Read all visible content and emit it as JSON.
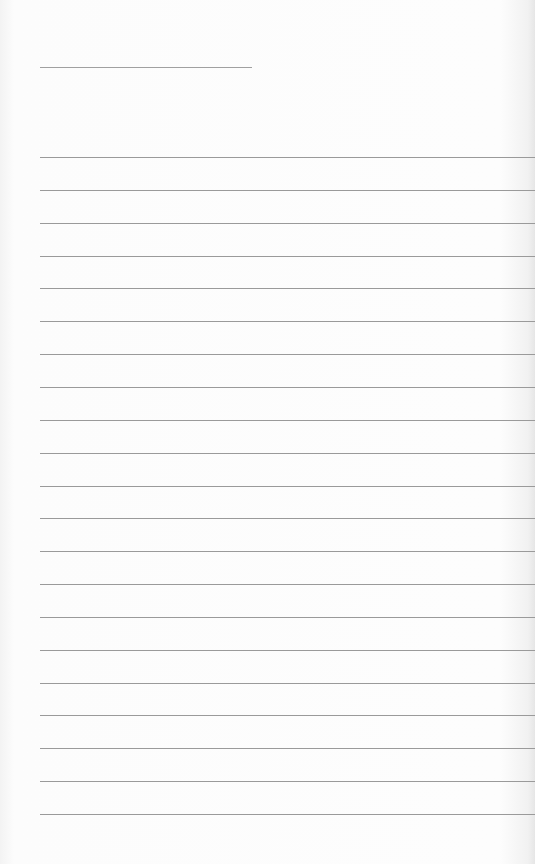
{
  "page": {
    "type": "lined-notebook-paper",
    "background_color": "#fbfbfb",
    "line_color": "#9a9a9a"
  },
  "title_line": {
    "x": 40,
    "y": 67,
    "width": 212
  },
  "ruled_lines": {
    "count": 21,
    "x": 40,
    "first_y": 157,
    "spacing": 32.85,
    "width": 495
  }
}
